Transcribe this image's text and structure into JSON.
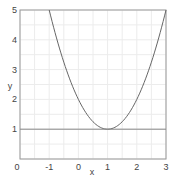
{
  "chart_data": {
    "type": "line",
    "title": "",
    "xlabel": "x",
    "ylabel": "y",
    "xlim": [
      -2,
      3
    ],
    "ylim": [
      0,
      5
    ],
    "x_ticks": [
      "0",
      "-1",
      "0",
      "1",
      "2",
      "3"
    ],
    "x_tick_values": [
      -2,
      -1,
      0,
      1,
      2,
      3
    ],
    "y_ticks": [
      "1",
      "2",
      "3",
      "4",
      "5"
    ],
    "y_tick_values": [
      1,
      2,
      3,
      4,
      5
    ],
    "grid": true,
    "legend": null,
    "series": [
      {
        "name": "y = (x-1)^2 + 1",
        "x": [
          -1,
          -0.5,
          0,
          0.5,
          1,
          1.5,
          2,
          2.5,
          3
        ],
        "values": [
          5,
          3.25,
          2,
          1.25,
          1,
          1.25,
          2,
          3.25,
          5
        ],
        "color": "#666666"
      },
      {
        "name": "y = 1",
        "x": [
          -2,
          3
        ],
        "values": [
          1,
          1
        ],
        "color": "#888888"
      }
    ]
  },
  "axis": {
    "xlabel": "x",
    "ylabel": "y"
  }
}
